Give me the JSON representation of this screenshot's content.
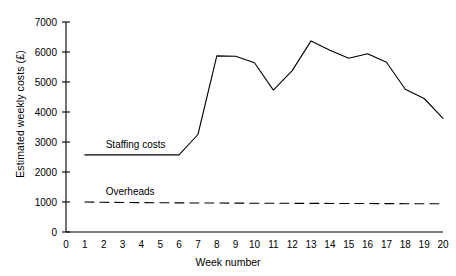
{
  "chart_data": {
    "type": "line",
    "title": "",
    "xlabel": "Week number",
    "ylabel": "Estimated weekly costs (£)",
    "xlim": [
      0,
      20
    ],
    "ylim": [
      0,
      7000
    ],
    "grid": false,
    "legend": "inline-labels",
    "xticks": [
      0,
      1,
      2,
      3,
      4,
      5,
      6,
      7,
      8,
      9,
      10,
      11,
      12,
      13,
      14,
      15,
      16,
      17,
      18,
      19,
      20
    ],
    "xtick_labels": [
      "0",
      "1",
      "2",
      "3",
      "4",
      "5",
      "6",
      "7",
      "8",
      "9",
      "10",
      "11",
      "12",
      "13",
      "14",
      "15",
      "16",
      "17",
      "18",
      "19",
      "20"
    ],
    "yticks": [
      0,
      1000,
      2000,
      3000,
      4000,
      5000,
      6000,
      7000
    ],
    "ytick_labels": [
      "0",
      "1000",
      "2000",
      "3000",
      "4000",
      "5000",
      "6000",
      "7000"
    ],
    "x": [
      1,
      2,
      3,
      4,
      5,
      6,
      7,
      8,
      9,
      10,
      11,
      12,
      13,
      14,
      15,
      16,
      17,
      18,
      19,
      20
    ],
    "series": [
      {
        "name": "Staffing costs",
        "style": "solid",
        "color": "#000000",
        "label_position": "above-line-week-2",
        "values": [
          2570,
          2570,
          2570,
          2570,
          2570,
          2570,
          3250,
          5870,
          5860,
          5640,
          4730,
          5380,
          6370,
          6060,
          5790,
          5940,
          5660,
          4760,
          4450,
          3790
        ]
      },
      {
        "name": "Overheads",
        "style": "dashed",
        "color": "#000000",
        "label_position": "above-line-week-2",
        "values": [
          1000,
          990,
          985,
          980,
          975,
          970,
          968,
          965,
          962,
          960,
          958,
          956,
          954,
          952,
          950,
          948,
          946,
          944,
          942,
          940
        ]
      }
    ]
  }
}
